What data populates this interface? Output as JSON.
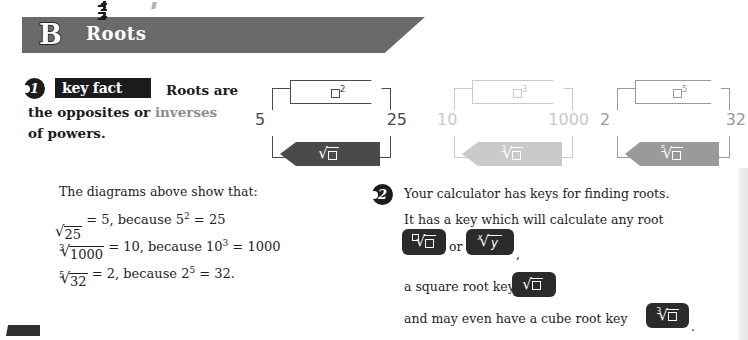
{
  "header": {
    "letter": "B",
    "title": "Roots"
  },
  "items": [
    {
      "marker": "1"
    },
    {
      "marker": "2"
    }
  ],
  "key_fact": {
    "badge": "key fact",
    "line1": "Roots are",
    "line2_a": "the opposites or ",
    "line2_b": "inverses",
    "line3": "of powers."
  },
  "diagrams": [
    {
      "left_value": "5",
      "right_value": "25",
      "top_op_base": "□",
      "top_op_exponent": "2",
      "bottom_op_index": "",
      "bottom_op_radicand": "□",
      "tone": "dark"
    },
    {
      "left_value": "10",
      "right_value": "1000",
      "top_op_base": "□",
      "top_op_exponent": "3",
      "bottom_op_index": "3",
      "bottom_op_radicand": "□",
      "tone": "light"
    },
    {
      "left_value": "2",
      "right_value": "32",
      "top_op_base": "□",
      "top_op_exponent": "5",
      "bottom_op_index": "5",
      "bottom_op_radicand": "□",
      "tone": "mid"
    }
  ],
  "left_column": {
    "intro": "The diagrams above show that:",
    "equations": [
      {
        "index": "",
        "radicand": "25",
        "rest_before_power": " = 5, because 5",
        "power": "2",
        "rest_after_power": " = 25"
      },
      {
        "index": "3",
        "radicand": "1000",
        "rest_before_power": "  = 10, because 10",
        "power": "3",
        "rest_after_power": " = 1000"
      },
      {
        "index": "5",
        "radicand": "32",
        "rest_before_power": " = 2, because 2",
        "power": "5",
        "rest_after_power": " = 32."
      }
    ]
  },
  "right_column": {
    "line1": "Your calculator has keys for finding roots.",
    "line2": "It has a key which will calculate any root",
    "or_label": "or",
    "comma": ",",
    "line3": "a square root key",
    "line4": "and may even have a cube root key",
    "period": ".",
    "keys": [
      {
        "name": "any-root-key",
        "index": "□",
        "radicand": "□"
      },
      {
        "name": "x-root-y-key",
        "index": "x",
        "radicand": "y"
      },
      {
        "name": "square-root-key",
        "index": "",
        "radicand": "□"
      },
      {
        "name": "cube-root-key",
        "index": "3",
        "radicand": "□"
      }
    ]
  },
  "colors": {
    "banner": "#6a6a6a",
    "ink": "#231f20",
    "key_fill": "#2b2b2b",
    "diagram_dark": "#4a4a4a",
    "diagram_light": "#c9c9c9",
    "diagram_mid": "#9a9a9a",
    "muted_text": "#8d8d8d"
  }
}
